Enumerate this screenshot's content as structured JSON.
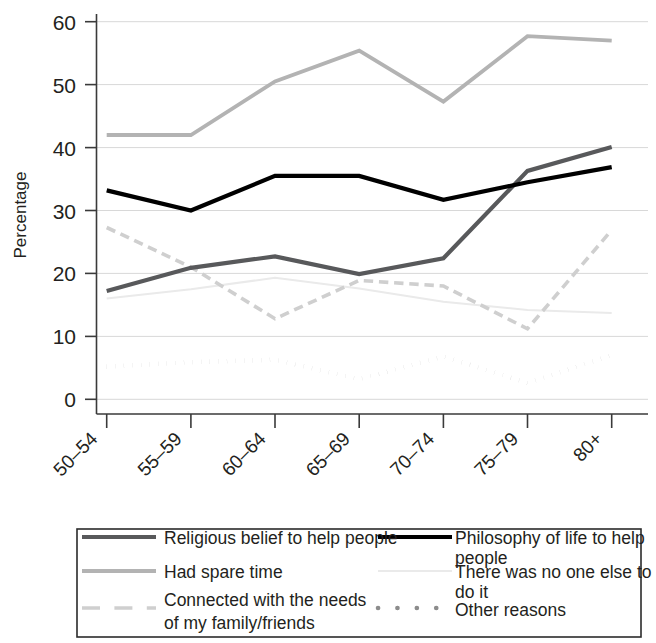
{
  "chart_data": {
    "type": "line",
    "title": "",
    "xlabel": "",
    "ylabel": "Percentage",
    "categories": [
      "50–54",
      "55–59",
      "60–64",
      "65–69",
      "70–74",
      "75–79",
      "80+"
    ],
    "ylim": [
      0,
      62
    ],
    "ytick_labels": [
      "0",
      "10",
      "20",
      "30",
      "40",
      "50",
      "60"
    ],
    "ytick_values": [
      0,
      10,
      20,
      30,
      40,
      50,
      60
    ],
    "grid": "horizontal",
    "legend_position": "bottom",
    "series": [
      {
        "name": "Religious belief to help people",
        "values": [
          17.2,
          20.9,
          22.7,
          19.9,
          22.4,
          36.3,
          40.1
        ],
        "color": "#58595b",
        "style": "solid",
        "width": 4.2
      },
      {
        "name": "Philosophy of life to help people",
        "values": [
          33.2,
          30.0,
          35.5,
          35.5,
          31.7,
          34.5,
          36.9
        ],
        "color": "#000000",
        "style": "solid",
        "width": 4.2
      },
      {
        "name": "Had spare time",
        "values": [
          42.0,
          42.0,
          50.5,
          55.4,
          47.3,
          57.7,
          57.0
        ],
        "color": "#b3b3b3",
        "style": "solid",
        "width": 3.8
      },
      {
        "name": "There was no one else to do it",
        "values": [
          16.0,
          17.5,
          19.3,
          17.6,
          15.5,
          14.2,
          13.7
        ],
        "color": "#eaeaea",
        "style": "solid",
        "width": 2.0
      },
      {
        "name": "Connected with the needs of my family/friends",
        "values": [
          27.3,
          21.0,
          12.8,
          18.9,
          18.0,
          11.2,
          26.9
        ],
        "color": "#cfcfcf",
        "style": "dashed",
        "width": 3.6
      },
      {
        "name": "Other reasons",
        "values": [
          5.2,
          5.9,
          6.3,
          3.2,
          6.8,
          2.6,
          7.0
        ],
        "color": "#8c8c8c",
        "style": "dotted",
        "width": 4.6
      }
    ]
  },
  "legend": {
    "entries": [
      {
        "label": "Religious belief to help people",
        "swatch": "solid-darkgray"
      },
      {
        "label": "Philosophy of life to help people",
        "swatch": "solid-black"
      },
      {
        "label": "Had spare time",
        "swatch": "solid-lightgray"
      },
      {
        "label": "There was no one else to do it",
        "swatch": "solid-palegray"
      },
      {
        "label_line1": "Connected with the needs",
        "label_line2": "of my family/friends",
        "swatch": "dashed-lightgray"
      },
      {
        "label": "Other reasons",
        "swatch": "dotted-gray"
      }
    ]
  },
  "axes": {
    "y_title": "Percentage"
  }
}
